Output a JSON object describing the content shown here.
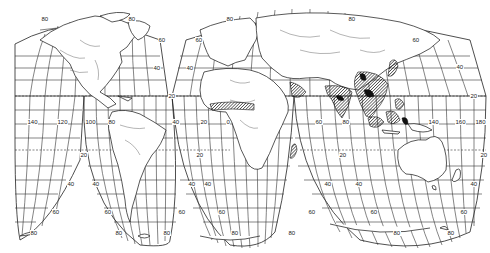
{
  "map": {
    "projection": "Interrupted Goode homolosine",
    "highlight_regions": [
      "West Africa (Guinea coast)",
      "India",
      "Southeast Asia / Indochina",
      "Indonesia",
      "Philippines",
      "Madagascar"
    ],
    "colors": {
      "background": "#ffffff",
      "lines": "#222222",
      "hatch": "#111111"
    },
    "labels": [
      {
        "text": "80",
        "x": 41,
        "y": 19
      },
      {
        "text": "80",
        "x": 128,
        "y": 19
      },
      {
        "text": "60",
        "x": 158,
        "y": 40
      },
      {
        "text": "40",
        "x": 153,
        "y": 68
      },
      {
        "text": "20",
        "x": 168,
        "y": 96
      },
      {
        "text": "140",
        "x": 27,
        "y": 122
      },
      {
        "text": "120",
        "x": 57,
        "y": 122
      },
      {
        "text": "100",
        "x": 85,
        "y": 122
      },
      {
        "text": "80",
        "x": 108,
        "y": 122
      },
      {
        "text": "40",
        "x": 172,
        "y": 122
      },
      {
        "text": "20",
        "x": 80,
        "y": 155
      },
      {
        "text": "40",
        "x": 67,
        "y": 184
      },
      {
        "text": "40",
        "x": 92,
        "y": 184
      },
      {
        "text": "40",
        "x": 188,
        "y": 184
      },
      {
        "text": "60",
        "x": 52,
        "y": 212
      },
      {
        "text": "60",
        "x": 104,
        "y": 212
      },
      {
        "text": "60",
        "x": 178,
        "y": 212
      },
      {
        "text": "80",
        "x": 30,
        "y": 233
      },
      {
        "text": "80",
        "x": 115,
        "y": 233
      },
      {
        "text": "80",
        "x": 163,
        "y": 233
      },
      {
        "text": "80",
        "x": 226,
        "y": 19
      },
      {
        "text": "60",
        "x": 195,
        "y": 40
      },
      {
        "text": "40",
        "x": 186,
        "y": 68
      },
      {
        "text": "80",
        "x": 348,
        "y": 19
      },
      {
        "text": "60",
        "x": 412,
        "y": 40
      },
      {
        "text": "40",
        "x": 456,
        "y": 67
      },
      {
        "text": "20",
        "x": 470,
        "y": 96
      },
      {
        "text": "20",
        "x": 200,
        "y": 122
      },
      {
        "text": "0",
        "x": 226,
        "y": 122
      },
      {
        "text": "20",
        "x": 196,
        "y": 155
      },
      {
        "text": "40",
        "x": 204,
        "y": 184
      },
      {
        "text": "60",
        "x": 218,
        "y": 212
      },
      {
        "text": "80",
        "x": 231,
        "y": 233
      },
      {
        "text": "60",
        "x": 315,
        "y": 122
      },
      {
        "text": "80",
        "x": 342,
        "y": 122
      },
      {
        "text": "140",
        "x": 428,
        "y": 122
      },
      {
        "text": "160",
        "x": 455,
        "y": 122
      },
      {
        "text": "180",
        "x": 475,
        "y": 122
      },
      {
        "text": "20",
        "x": 339,
        "y": 155
      },
      {
        "text": "20",
        "x": 480,
        "y": 155
      },
      {
        "text": "40",
        "x": 324,
        "y": 184
      },
      {
        "text": "40",
        "x": 355,
        "y": 184
      },
      {
        "text": "40",
        "x": 470,
        "y": 184
      },
      {
        "text": "60",
        "x": 308,
        "y": 212
      },
      {
        "text": "60",
        "x": 370,
        "y": 212
      },
      {
        "text": "60",
        "x": 460,
        "y": 212
      },
      {
        "text": "80",
        "x": 288,
        "y": 233
      },
      {
        "text": "80",
        "x": 393,
        "y": 233
      },
      {
        "text": "80",
        "x": 447,
        "y": 233
      }
    ]
  }
}
